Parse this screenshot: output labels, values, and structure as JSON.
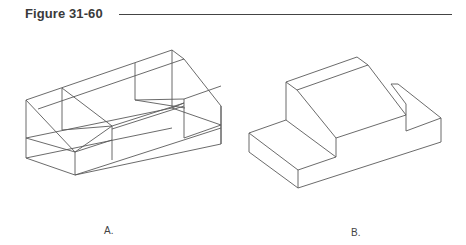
{
  "figure": {
    "title": "Figure 31-60",
    "panels": [
      {
        "label": "A.",
        "description": "wireframe isometric view of block with two raised ends and slanted top"
      },
      {
        "label": "B.",
        "description": "solid isometric view of stepped block with slanted face"
      }
    ]
  }
}
